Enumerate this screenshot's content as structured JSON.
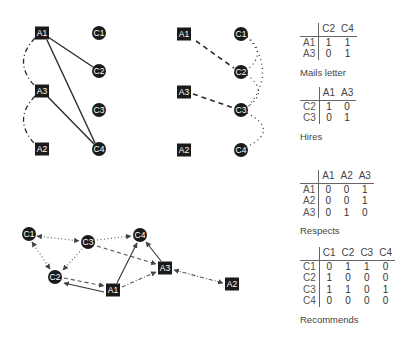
{
  "graphs": {
    "mails_letter": {
      "nodes": [
        {
          "id": "A1",
          "shape": "square",
          "x": 42,
          "y": 33
        },
        {
          "id": "A3",
          "shape": "square",
          "x": 42,
          "y": 91
        },
        {
          "id": "A2",
          "shape": "square",
          "x": 42,
          "y": 149
        },
        {
          "id": "C1",
          "shape": "circle",
          "x": 99,
          "y": 33
        },
        {
          "id": "C2",
          "shape": "circle",
          "x": 99,
          "y": 71
        },
        {
          "id": "C3",
          "shape": "circle",
          "x": 99,
          "y": 110
        },
        {
          "id": "C4",
          "shape": "circle",
          "x": 99,
          "y": 149
        }
      ],
      "edges": [
        {
          "from": "A1",
          "to": "C2",
          "style": "solid"
        },
        {
          "from": "A1",
          "to": "C4",
          "style": "solid"
        },
        {
          "from": "A3",
          "to": "C4",
          "style": "solid"
        },
        {
          "from": "A1",
          "to": "A3",
          "style": "dashdot-arc"
        },
        {
          "from": "A3",
          "to": "A2",
          "style": "dashdot-arc"
        }
      ]
    },
    "hires": {
      "nodes": [
        {
          "id": "A1",
          "shape": "square",
          "x": 184,
          "y": 34
        },
        {
          "id": "A3",
          "shape": "square",
          "x": 184,
          "y": 92
        },
        {
          "id": "A2",
          "shape": "square",
          "x": 184,
          "y": 150
        },
        {
          "id": "C1",
          "shape": "circle",
          "x": 241,
          "y": 34
        },
        {
          "id": "C2",
          "shape": "circle",
          "x": 241,
          "y": 72
        },
        {
          "id": "C3",
          "shape": "circle",
          "x": 241,
          "y": 110
        },
        {
          "id": "C4",
          "shape": "circle",
          "x": 241,
          "y": 150
        }
      ],
      "edges": [
        {
          "from": "A1",
          "to": "C2",
          "style": "dashed"
        },
        {
          "from": "A3",
          "to": "C3",
          "style": "dashed"
        },
        {
          "from": "C1",
          "to": "C2",
          "style": "dotted-arc"
        },
        {
          "from": "C1",
          "to": "C3",
          "style": "dotted-arc"
        },
        {
          "from": "C2",
          "to": "C3",
          "style": "dotted-arc"
        },
        {
          "from": "C3",
          "to": "C4",
          "style": "dotted-arc"
        }
      ]
    },
    "combined": {
      "nodes": [
        {
          "id": "C1",
          "shape": "circle",
          "x": 29,
          "y": 234
        },
        {
          "id": "C3",
          "shape": "circle",
          "x": 88,
          "y": 242
        },
        {
          "id": "C4",
          "shape": "circle",
          "x": 140,
          "y": 235
        },
        {
          "id": "C2",
          "shape": "circle",
          "x": 55,
          "y": 277
        },
        {
          "id": "A1",
          "shape": "square",
          "x": 113,
          "y": 290
        },
        {
          "id": "A3",
          "shape": "square",
          "x": 165,
          "y": 268
        },
        {
          "id": "A2",
          "shape": "square",
          "x": 232,
          "y": 284
        }
      ],
      "edges": [
        {
          "from": "C1",
          "to": "C3",
          "style": "dotted",
          "arrows": "both"
        },
        {
          "from": "C1",
          "to": "C2",
          "style": "dotted",
          "arrows": "both"
        },
        {
          "from": "C3",
          "to": "C2",
          "style": "dotted",
          "arrows": "end"
        },
        {
          "from": "C3",
          "to": "C4",
          "style": "dotted",
          "arrows": "end"
        },
        {
          "from": "C3",
          "to": "A3",
          "style": "dashed",
          "arrows": "end"
        },
        {
          "from": "C2",
          "to": "A1",
          "style": "dashed",
          "arrows": "end"
        },
        {
          "from": "A1",
          "to": "C2",
          "style": "solid",
          "arrows": "end"
        },
        {
          "from": "A1",
          "to": "C4",
          "style": "solid",
          "arrows": "end"
        },
        {
          "from": "A3",
          "to": "C4",
          "style": "solid",
          "arrows": "end"
        },
        {
          "from": "A1",
          "to": "A3",
          "style": "dashdot",
          "arrows": "end"
        },
        {
          "from": "A3",
          "to": "A2",
          "style": "dashdot",
          "arrows": "both"
        }
      ]
    }
  },
  "tables": {
    "mails_letter": {
      "caption": "Mails letter",
      "cols": [
        "C2",
        "C4"
      ],
      "rows": [
        {
          "label": "A1",
          "values": [
            "1",
            "1"
          ]
        },
        {
          "label": "A3",
          "values": [
            "0",
            "1"
          ]
        }
      ]
    },
    "hires": {
      "caption": "Hires",
      "cols": [
        "A1",
        "A3"
      ],
      "rows": [
        {
          "label": "C2",
          "values": [
            "1",
            "0"
          ]
        },
        {
          "label": "C3",
          "values": [
            "0",
            "1"
          ]
        }
      ]
    },
    "respects": {
      "caption": "Respects",
      "cols": [
        "A1",
        "A2",
        "A3"
      ],
      "rows": [
        {
          "label": "A1",
          "values": [
            "0",
            "0",
            "1"
          ]
        },
        {
          "label": "A2",
          "values": [
            "0",
            "0",
            "1"
          ]
        },
        {
          "label": "A3",
          "values": [
            "0",
            "1",
            "0"
          ]
        }
      ]
    },
    "recommends": {
      "caption": "Recommends",
      "cols": [
        "C1",
        "C2",
        "C3",
        "C4"
      ],
      "rows": [
        {
          "label": "C1",
          "values": [
            "0",
            "1",
            "1",
            "0"
          ]
        },
        {
          "label": "C2",
          "values": [
            "1",
            "0",
            "0",
            "0"
          ]
        },
        {
          "label": "C3",
          "values": [
            "1",
            "1",
            "0",
            "1"
          ]
        },
        {
          "label": "C4",
          "values": [
            "0",
            "0",
            "0",
            "0"
          ]
        }
      ]
    }
  },
  "colors": {
    "node_fill": "#1a1a1a",
    "node_text": "#ffffff",
    "edge": "#333333",
    "edge_light": "#666666"
  }
}
